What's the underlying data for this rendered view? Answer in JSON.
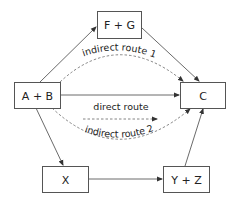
{
  "diagram": {
    "nodes": [
      {
        "id": "ab",
        "label": "A + B"
      },
      {
        "id": "fg",
        "label": "F + G"
      },
      {
        "id": "c",
        "label": "C"
      },
      {
        "id": "x",
        "label": "X"
      },
      {
        "id": "yz",
        "label": "Y + Z"
      }
    ],
    "edges": [
      {
        "from": "A + B",
        "to": "F + G",
        "style": "solid"
      },
      {
        "from": "F + G",
        "to": "C",
        "style": "solid"
      },
      {
        "from": "A + B",
        "to": "C",
        "style": "solid"
      },
      {
        "from": "A + B",
        "to": "X",
        "style": "solid"
      },
      {
        "from": "X",
        "to": "Y + Z",
        "style": "solid"
      },
      {
        "from": "Y + Z",
        "to": "C",
        "style": "solid"
      }
    ],
    "routes": {
      "indirect1": "indirect route 1",
      "direct": "direct route",
      "indirect2": "indirect route 2"
    }
  }
}
